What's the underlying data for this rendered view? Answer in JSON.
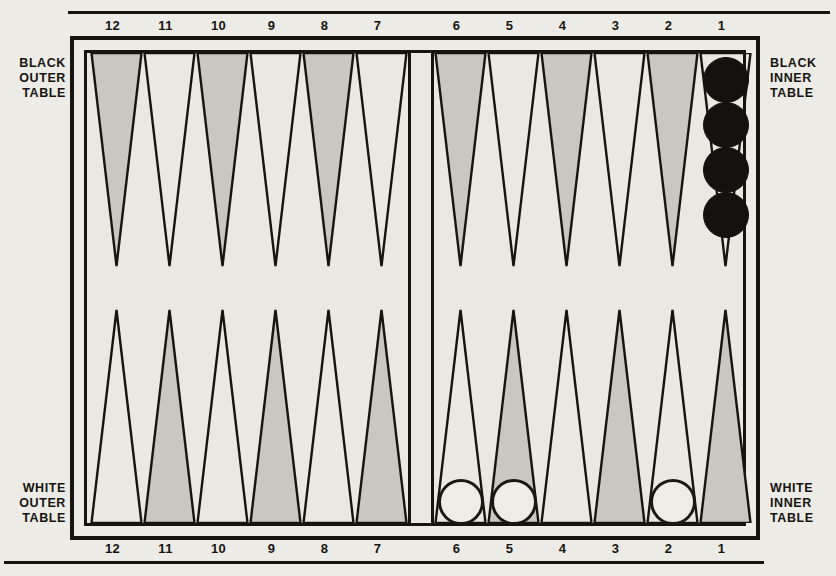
{
  "board": {
    "title": "Backgammon board setup diagram",
    "point_numbers_top": [
      "12",
      "11",
      "10",
      "9",
      "8",
      "7",
      "6",
      "5",
      "4",
      "3",
      "2",
      "1"
    ],
    "point_numbers_bottom": [
      "12",
      "11",
      "10",
      "9",
      "8",
      "7",
      "6",
      "5",
      "4",
      "3",
      "2",
      "1"
    ],
    "labels": {
      "black_outer": "BLACK\nOUTER\nTABLE",
      "black_inner": "BLACK\nINNER\nTABLE",
      "white_outer": "WHITE\nOUTER\nTABLE",
      "white_inner": "WHITE\nINNER\nTABLE"
    },
    "colors": {
      "ink": "#16140f",
      "paper": "#edebe6",
      "point_shaded": "#c9c7c1",
      "checker_black": "#14120e",
      "checker_white": "#eeece7"
    }
  },
  "chart_data": {
    "type": "table",
    "top_row": {
      "table_left": "BLACK OUTER TABLE",
      "table_right": "BLACK INNER TABLE",
      "points": [
        {
          "number": "12",
          "shaded": true,
          "checkers": 0,
          "color": ""
        },
        {
          "number": "11",
          "shaded": false,
          "checkers": 0,
          "color": ""
        },
        {
          "number": "10",
          "shaded": true,
          "checkers": 0,
          "color": ""
        },
        {
          "number": "9",
          "shaded": false,
          "checkers": 0,
          "color": ""
        },
        {
          "number": "8",
          "shaded": true,
          "checkers": 0,
          "color": ""
        },
        {
          "number": "7",
          "shaded": false,
          "checkers": 0,
          "color": ""
        },
        {
          "number": "6",
          "shaded": true,
          "checkers": 0,
          "color": ""
        },
        {
          "number": "5",
          "shaded": false,
          "checkers": 0,
          "color": ""
        },
        {
          "number": "4",
          "shaded": true,
          "checkers": 0,
          "color": ""
        },
        {
          "number": "3",
          "shaded": false,
          "checkers": 0,
          "color": ""
        },
        {
          "number": "2",
          "shaded": true,
          "checkers": 0,
          "color": ""
        },
        {
          "number": "1",
          "shaded": false,
          "checkers": 4,
          "color": "black"
        }
      ]
    },
    "bottom_row": {
      "table_left": "WHITE OUTER TABLE",
      "table_right": "WHITE INNER TABLE",
      "points": [
        {
          "number": "12",
          "shaded": false,
          "checkers": 0,
          "color": ""
        },
        {
          "number": "11",
          "shaded": true,
          "checkers": 0,
          "color": ""
        },
        {
          "number": "10",
          "shaded": false,
          "checkers": 0,
          "color": ""
        },
        {
          "number": "9",
          "shaded": true,
          "checkers": 0,
          "color": ""
        },
        {
          "number": "8",
          "shaded": false,
          "checkers": 0,
          "color": ""
        },
        {
          "number": "7",
          "shaded": true,
          "checkers": 0,
          "color": ""
        },
        {
          "number": "6",
          "shaded": false,
          "checkers": 1,
          "color": "white"
        },
        {
          "number": "5",
          "shaded": true,
          "checkers": 1,
          "color": "white"
        },
        {
          "number": "4",
          "shaded": false,
          "checkers": 0,
          "color": ""
        },
        {
          "number": "3",
          "shaded": true,
          "checkers": 0,
          "color": ""
        },
        {
          "number": "2",
          "shaded": false,
          "checkers": 1,
          "color": "white"
        },
        {
          "number": "1",
          "shaded": true,
          "checkers": 0,
          "color": ""
        }
      ]
    },
    "totals": {
      "black_checkers_shown": 4,
      "white_checkers_shown": 3
    }
  }
}
